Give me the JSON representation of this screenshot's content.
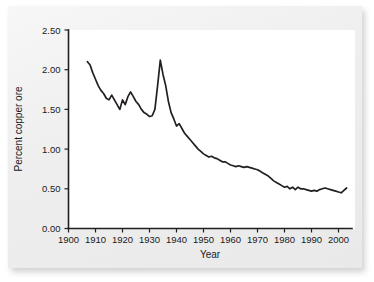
{
  "chart_data": {
    "type": "line",
    "title": "",
    "xlabel": "Year",
    "ylabel": "Percent copper ore",
    "xlim": [
      1900,
      2005
    ],
    "ylim": [
      0.0,
      2.5
    ],
    "grid": false,
    "legend": "none",
    "x_ticks": [
      "1900",
      "1910",
      "1920",
      "1930",
      "1940",
      "1950",
      "1960",
      "1970",
      "1980",
      "1990",
      "2000"
    ],
    "y_ticks": [
      "0.00",
      "0.50",
      "1.00",
      "1.50",
      "2.00",
      "2.50"
    ],
    "series": [
      {
        "name": "Percent copper ore",
        "color": "#231f20",
        "x": [
          1907,
          1908,
          1909,
          1910,
          1911,
          1912,
          1913,
          1914,
          1915,
          1916,
          1917,
          1918,
          1919,
          1920,
          1921,
          1922,
          1923,
          1924,
          1925,
          1926,
          1927,
          1928,
          1929,
          1930,
          1931,
          1932,
          1933,
          1934,
          1935,
          1936,
          1937,
          1938,
          1939,
          1940,
          1941,
          1942,
          1943,
          1944,
          1945,
          1946,
          1947,
          1948,
          1949,
          1950,
          1951,
          1952,
          1953,
          1954,
          1955,
          1956,
          1957,
          1958,
          1959,
          1960,
          1961,
          1962,
          1963,
          1964,
          1965,
          1966,
          1967,
          1968,
          1969,
          1970,
          1971,
          1972,
          1973,
          1974,
          1975,
          1976,
          1977,
          1978,
          1979,
          1980,
          1981,
          1982,
          1983,
          1984,
          1985,
          1986,
          1987,
          1988,
          1989,
          1990,
          1991,
          1992,
          1993,
          1994,
          1995,
          1996,
          1997,
          1998,
          1999,
          2000,
          2001,
          2002,
          2003
        ],
        "values": [
          2.1,
          2.06,
          1.96,
          1.88,
          1.8,
          1.74,
          1.7,
          1.64,
          1.62,
          1.68,
          1.62,
          1.56,
          1.5,
          1.62,
          1.56,
          1.66,
          1.72,
          1.66,
          1.6,
          1.56,
          1.5,
          1.46,
          1.44,
          1.41,
          1.42,
          1.5,
          1.8,
          2.12,
          1.94,
          1.8,
          1.6,
          1.46,
          1.38,
          1.29,
          1.32,
          1.26,
          1.2,
          1.16,
          1.12,
          1.08,
          1.04,
          1.0,
          0.97,
          0.94,
          0.92,
          0.9,
          0.91,
          0.89,
          0.88,
          0.86,
          0.84,
          0.84,
          0.82,
          0.8,
          0.79,
          0.78,
          0.79,
          0.78,
          0.77,
          0.78,
          0.77,
          0.76,
          0.75,
          0.74,
          0.72,
          0.7,
          0.68,
          0.66,
          0.63,
          0.6,
          0.58,
          0.56,
          0.54,
          0.52,
          0.53,
          0.5,
          0.52,
          0.49,
          0.52,
          0.5,
          0.5,
          0.49,
          0.48,
          0.47,
          0.48,
          0.47,
          0.49,
          0.5,
          0.51,
          0.5,
          0.49,
          0.48,
          0.47,
          0.46,
          0.45,
          0.48,
          0.51
        ]
      }
    ]
  },
  "axes": {
    "y_label": "Percent copper ore",
    "x_label": "Year"
  }
}
